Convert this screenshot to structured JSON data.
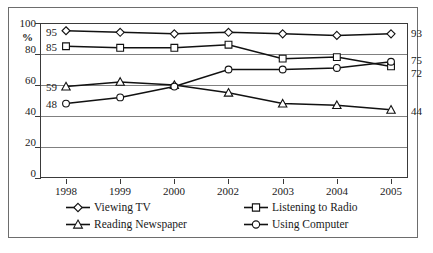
{
  "chart_data": {
    "type": "line",
    "title": "",
    "xlabel": "",
    "ylabel": "%",
    "categories": [
      "1998",
      "1999",
      "2000",
      "2002",
      "2003",
      "2004",
      "2005"
    ],
    "ylim": [
      0,
      100
    ],
    "yticks": [
      0,
      20,
      40,
      60,
      80,
      100
    ],
    "grid": true,
    "legend_position": "bottom",
    "series": [
      {
        "name": "Viewing TV",
        "marker": "diamond",
        "values": [
          95,
          94,
          93,
          94,
          93,
          92,
          93
        ]
      },
      {
        "name": "Listening to Radio",
        "marker": "square",
        "values": [
          85,
          84,
          84,
          86,
          77,
          78,
          72
        ]
      },
      {
        "name": "Reading Newspaper",
        "marker": "triangle",
        "values": [
          59,
          62,
          60,
          55,
          48,
          47,
          44
        ]
      },
      {
        "name": "Using Computer",
        "marker": "circle",
        "values": [
          48,
          52,
          59,
          70,
          70,
          71,
          75
        ]
      }
    ],
    "start_labels": [
      "95",
      "85",
      "59",
      "48"
    ],
    "end_labels": [
      "93",
      "75",
      "72",
      "44"
    ],
    "colors": {
      "line": "#111111",
      "marker_fill": "#ffffff",
      "grid": "#808080",
      "axis": "#3a3a3a"
    }
  },
  "axis": {
    "y_tick_labels": [
      "100",
      "80",
      "60",
      "40",
      "20",
      "0"
    ],
    "y_unit_label": "%",
    "x_tick_labels": [
      "1998",
      "1999",
      "2000",
      "2002",
      "2003",
      "2004",
      "2005"
    ]
  },
  "annotations": {
    "left": [
      {
        "text": "95",
        "series": "Viewing TV"
      },
      {
        "text": "85",
        "series": "Listening to Radio"
      },
      {
        "text": "59",
        "series": "Reading Newspaper"
      },
      {
        "text": "48",
        "series": "Using Computer"
      }
    ],
    "right": [
      {
        "text": "93",
        "series": "Viewing TV"
      },
      {
        "text": "75",
        "series": "Using Computer"
      },
      {
        "text": "72",
        "series": "Listening to Radio"
      },
      {
        "text": "44",
        "series": "Reading Newspaper"
      }
    ]
  },
  "legend": {
    "items": [
      {
        "label": "Viewing TV",
        "marker": "diamond"
      },
      {
        "label": "Listening to Radio",
        "marker": "square"
      },
      {
        "label": "Reading Newspaper",
        "marker": "triangle"
      },
      {
        "label": "Using Computer",
        "marker": "circle"
      }
    ]
  }
}
